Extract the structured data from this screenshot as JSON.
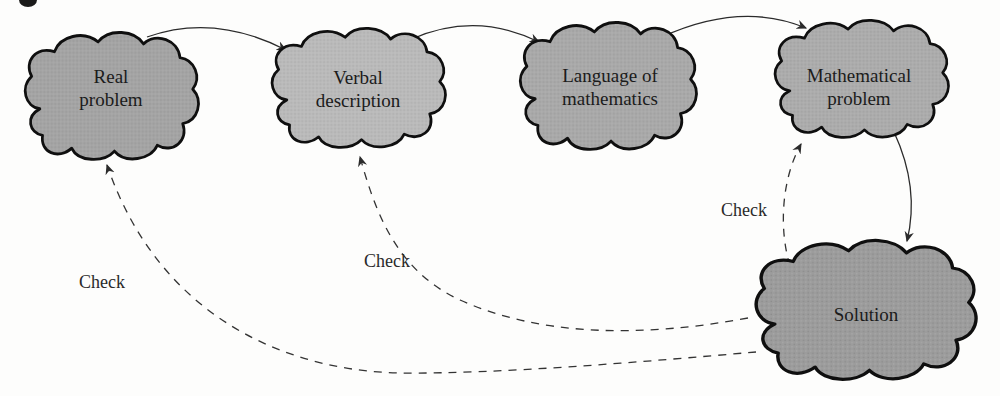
{
  "figure": {
    "background": "#fdfdfc",
    "outline_color": "#0f0f0f",
    "arrow_color": "#2b2b2b",
    "text_color": "#1b1b1b",
    "clouds": [
      {
        "name": "real-problem",
        "label_line1": "Real",
        "label_line2": "problem",
        "fill": "#a4a4a4"
      },
      {
        "name": "verbal-description",
        "label_line1": "Verbal",
        "label_line2": "description",
        "fill": "#bababa"
      },
      {
        "name": "language-of-mathematics",
        "label_line1": "Language of",
        "label_line2": "mathematics",
        "fill": "#a9a9a9"
      },
      {
        "name": "mathematical-problem",
        "label_line1": "Mathematical",
        "label_line2": "problem",
        "fill": "#acacac"
      },
      {
        "name": "solution",
        "label_line1": "Solution",
        "label_line2": "",
        "fill": "#9c9c9c"
      }
    ],
    "check_labels": [
      {
        "text": "Check"
      },
      {
        "text": "Check"
      },
      {
        "text": "Check"
      }
    ]
  }
}
